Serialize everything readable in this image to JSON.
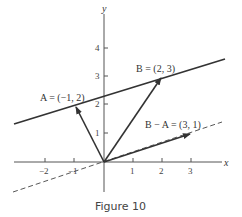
{
  "figure": {
    "caption": "Figure 10",
    "axes": {
      "x_label": "x",
      "y_label": "y",
      "x_ticks": [
        "−2",
        "−1",
        "1",
        "2",
        "3"
      ],
      "y_ticks": [
        "1",
        "2",
        "3",
        "4"
      ]
    },
    "vectors": [
      {
        "label": "A = (−1, 2)",
        "x": -1,
        "y": 2
      },
      {
        "label": "B = (2, 3)",
        "x": 2,
        "y": 3
      },
      {
        "label": "B − A = (3, 1)",
        "x": 3,
        "y": 1
      }
    ],
    "lines": [
      {
        "name": "line-through-A-and-B",
        "style": "solid",
        "slope": "1/3",
        "through": [
          [
            -1,
            2
          ],
          [
            2,
            3
          ]
        ]
      },
      {
        "name": "line-through-origin-parallel",
        "style": "dashed",
        "slope": "1/3",
        "through": [
          [
            0,
            0
          ],
          [
            3,
            1
          ]
        ]
      }
    ],
    "colors": {
      "ink": "#333333",
      "background": "#ffffff"
    }
  }
}
